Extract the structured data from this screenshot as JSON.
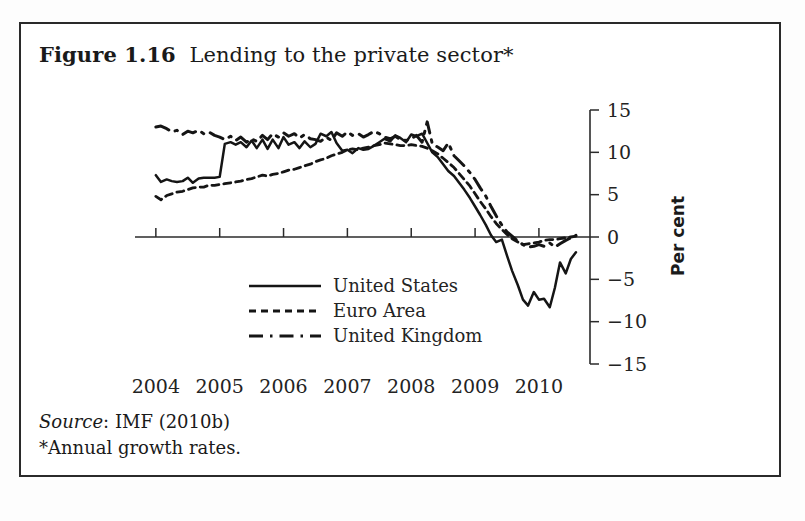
{
  "figure": {
    "number": "Figure 1.16",
    "caption": "Lending to the private sector*",
    "source_prefix": "Source",
    "source_rest": ": IMF (2010b)",
    "note": "*Annual growth rates."
  },
  "chart_data": {
    "type": "line",
    "title": "Lending to the private sector*",
    "xlabel": "",
    "ylabel": "Per cent",
    "xlim": [
      2003.83,
      2010.8
    ],
    "ylim": [
      -15,
      15
    ],
    "grid": false,
    "legend_position": "inside-lower-left",
    "x_tick_labels": [
      "2004",
      "2005",
      "2006",
      "2007",
      "2008",
      "2009",
      "2010"
    ],
    "x_ticks": [
      2004,
      2005,
      2006,
      2007,
      2008,
      2009,
      2010
    ],
    "y_tick_labels": [
      "15",
      "10",
      "5",
      "0",
      "−5",
      "−10",
      "−15"
    ],
    "y_ticks": [
      15,
      10,
      5,
      0,
      -5,
      -10,
      -15
    ],
    "series": [
      {
        "name": "United States",
        "style": "solid",
        "x": [
          2004.0,
          2004.08,
          2004.17,
          2004.25,
          2004.33,
          2004.42,
          2004.5,
          2004.58,
          2004.67,
          2004.75,
          2004.83,
          2004.92,
          2005.0,
          2005.08,
          2005.17,
          2005.25,
          2005.33,
          2005.42,
          2005.5,
          2005.58,
          2005.67,
          2005.75,
          2005.83,
          2005.92,
          2006.0,
          2006.08,
          2006.17,
          2006.25,
          2006.33,
          2006.42,
          2006.5,
          2006.58,
          2006.67,
          2006.75,
          2006.83,
          2006.92,
          2007.0,
          2007.08,
          2007.17,
          2007.25,
          2007.33,
          2007.42,
          2007.5,
          2007.58,
          2007.67,
          2007.75,
          2007.83,
          2007.92,
          2008.0,
          2008.08,
          2008.17,
          2008.25,
          2008.33,
          2008.42,
          2008.5,
          2008.58,
          2008.67,
          2008.75,
          2008.83,
          2008.92,
          2009.0,
          2009.08,
          2009.17,
          2009.25,
          2009.33,
          2009.42,
          2009.5,
          2009.58,
          2009.67,
          2009.75,
          2009.83,
          2009.92,
          2010.0,
          2010.08,
          2010.17,
          2010.25,
          2010.33,
          2010.42,
          2010.5,
          2010.58
        ],
        "y": [
          7.3,
          6.5,
          6.8,
          6.6,
          6.5,
          6.6,
          7.0,
          6.4,
          6.9,
          7.0,
          7.0,
          7.0,
          7.1,
          11.0,
          11.2,
          10.9,
          11.2,
          10.6,
          11.4,
          10.5,
          11.5,
          10.4,
          11.5,
          10.5,
          11.8,
          10.9,
          11.2,
          10.5,
          11.3,
          10.6,
          11.0,
          12.2,
          11.9,
          12.4,
          11.1,
          10.2,
          10.3,
          9.9,
          10.5,
          10.3,
          10.4,
          10.8,
          11.2,
          11.6,
          11.3,
          12.0,
          11.7,
          11.2,
          12.1,
          11.9,
          12.2,
          11.1,
          10.0,
          9.4,
          8.6,
          7.8,
          7.2,
          6.4,
          5.6,
          4.6,
          3.6,
          2.6,
          1.4,
          0.2,
          -0.6,
          -0.3,
          -2.2,
          -4.0,
          -5.7,
          -7.4,
          -8.1,
          -6.5,
          -7.4,
          -7.3,
          -8.3,
          -6.0,
          -3.0,
          -4.3,
          -2.6,
          -1.8
        ]
      },
      {
        "name": "Euro Area",
        "style": "dotted",
        "x": [
          2004.0,
          2004.08,
          2004.17,
          2004.25,
          2004.33,
          2004.42,
          2004.5,
          2004.58,
          2004.67,
          2004.75,
          2004.83,
          2004.92,
          2005.0,
          2005.08,
          2005.17,
          2005.25,
          2005.33,
          2005.42,
          2005.5,
          2005.58,
          2005.67,
          2005.75,
          2005.83,
          2005.92,
          2006.0,
          2006.08,
          2006.17,
          2006.25,
          2006.33,
          2006.42,
          2006.5,
          2006.58,
          2006.67,
          2006.75,
          2006.83,
          2006.92,
          2007.0,
          2007.08,
          2007.17,
          2007.25,
          2007.33,
          2007.42,
          2007.5,
          2007.58,
          2007.67,
          2007.75,
          2007.83,
          2007.92,
          2008.0,
          2008.08,
          2008.17,
          2008.25,
          2008.33,
          2008.42,
          2008.5,
          2008.58,
          2008.67,
          2008.75,
          2008.83,
          2008.92,
          2009.0,
          2009.08,
          2009.17,
          2009.25,
          2009.33,
          2009.42,
          2009.5,
          2009.58,
          2009.67,
          2009.75,
          2009.83,
          2009.92,
          2010.0,
          2010.08,
          2010.17,
          2010.25,
          2010.33,
          2010.42,
          2010.5,
          2010.58
        ],
        "y": [
          4.8,
          4.4,
          4.9,
          5.1,
          5.3,
          5.4,
          5.6,
          5.8,
          5.9,
          5.9,
          6.1,
          6.1,
          6.2,
          6.3,
          6.4,
          6.5,
          6.6,
          6.8,
          6.9,
          7.1,
          7.3,
          7.2,
          7.4,
          7.5,
          7.7,
          7.9,
          8.0,
          8.2,
          8.4,
          8.6,
          8.9,
          9.1,
          9.3,
          9.6,
          9.8,
          10.0,
          10.3,
          10.4,
          10.3,
          10.5,
          10.6,
          10.8,
          10.9,
          11.1,
          11.0,
          10.9,
          10.8,
          10.8,
          10.9,
          10.8,
          10.7,
          10.5,
          10.2,
          9.8,
          9.3,
          8.8,
          8.2,
          7.5,
          6.8,
          6.0,
          5.1,
          4.2,
          3.3,
          2.4,
          1.6,
          0.9,
          0.3,
          -0.2,
          -0.6,
          -0.9,
          -0.8,
          -0.7,
          -0.6,
          -0.4,
          -0.3,
          -0.3,
          -0.2,
          -0.1,
          0.0,
          0.1
        ]
      },
      {
        "name": "United Kingdom",
        "style": "dashed",
        "x": [
          2004.0,
          2004.08,
          2004.17,
          2004.25,
          2004.33,
          2004.42,
          2004.5,
          2004.58,
          2004.67,
          2004.75,
          2004.83,
          2004.92,
          2005.0,
          2005.08,
          2005.17,
          2005.25,
          2005.33,
          2005.42,
          2005.5,
          2005.58,
          2005.67,
          2005.75,
          2005.83,
          2005.92,
          2006.0,
          2006.08,
          2006.17,
          2006.25,
          2006.33,
          2006.42,
          2006.5,
          2006.58,
          2006.67,
          2006.75,
          2006.83,
          2006.92,
          2007.0,
          2007.08,
          2007.17,
          2007.25,
          2007.33,
          2007.42,
          2007.5,
          2007.58,
          2007.67,
          2007.75,
          2007.83,
          2007.92,
          2008.0,
          2008.08,
          2008.17,
          2008.25,
          2008.33,
          2008.42,
          2008.5,
          2008.58,
          2008.67,
          2008.75,
          2008.83,
          2008.92,
          2009.0,
          2009.08,
          2009.17,
          2009.25,
          2009.33,
          2009.42,
          2009.5,
          2009.58,
          2009.67,
          2009.75,
          2009.83,
          2009.92,
          2010.0,
          2010.08,
          2010.17,
          2010.25,
          2010.33,
          2010.42,
          2010.5,
          2010.58
        ],
        "y": [
          13.0,
          13.1,
          12.8,
          12.4,
          12.6,
          12.1,
          12.5,
          12.3,
          12.6,
          12.2,
          12.4,
          12.0,
          11.8,
          11.5,
          11.9,
          11.4,
          11.8,
          11.2,
          11.6,
          11.3,
          12.0,
          11.5,
          12.2,
          11.8,
          12.3,
          11.9,
          12.2,
          11.7,
          12.1,
          11.6,
          11.5,
          11.3,
          11.8,
          11.4,
          12.3,
          11.9,
          12.4,
          12.0,
          12.2,
          11.8,
          12.1,
          12.5,
          12.2,
          11.8,
          11.6,
          11.9,
          11.5,
          11.4,
          11.6,
          12.0,
          11.2,
          13.6,
          11.0,
          10.6,
          10.2,
          11.1,
          9.6,
          9.0,
          8.4,
          7.6,
          6.8,
          5.8,
          4.8,
          3.6,
          2.5,
          1.4,
          0.6,
          0.1,
          -0.5,
          -0.9,
          -1.2,
          -1.1,
          -0.9,
          -1.1,
          -0.7,
          -1.2,
          -0.8,
          -0.4,
          -0.1,
          0.2
        ]
      }
    ]
  },
  "legend": {
    "items": [
      {
        "label": "United States",
        "style": "solid"
      },
      {
        "label": "Euro Area",
        "style": "dotted"
      },
      {
        "label": "United Kingdom",
        "style": "dashed"
      }
    ]
  }
}
